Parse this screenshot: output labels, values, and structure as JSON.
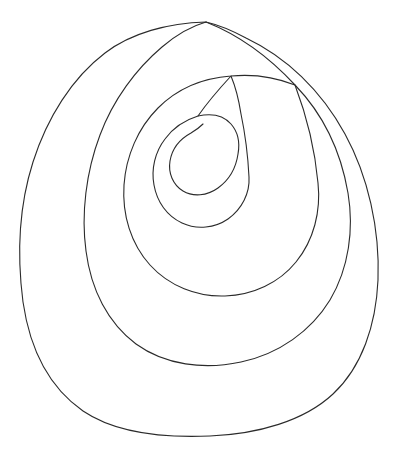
{
  "artwork": {
    "title": "Spiral Outline Drawing",
    "kind": "line-art",
    "subject": "egg-shaped archimedean spiral",
    "description": "A single continuous closed black outline drawn as an egg-shaped spiral with about two and a half turns, ending in a sharp point at the top and a rounded teardrop hook at the center.",
    "background_color": "#ffffff",
    "stroke_color": "#2b2b2b",
    "stroke_width_px": 1.1,
    "fill": "none",
    "canvas": {
      "width_px": 394,
      "height_px": 460
    },
    "geometry": {
      "center_x": 200,
      "center_y": 215,
      "outer_tip_x": 206,
      "outer_tip_y": 22,
      "inner_hook_x": 215,
      "inner_hook_y": 150,
      "bounds": {
        "left_px": 20,
        "right_px": 378,
        "top_px": 21,
        "bottom_px": 436
      },
      "turns": 2.5,
      "path_d": "M 206 22 C 150 24 104 50 74 90 C 42 132 24 186 21 240 C 18 300 33 356 69 396 C 106 437 162 456 219 452 C 283 447 337 414 360 356 C 384 296 382 226 364 162 C 346 100 310 56 258 36 C 238 28 222 24 206 22 Z M 206 22 C 216 22 223 24 230 27 C 278 47 311 90 327 146 C 344 206 345 271 323 325 C 302 376 254 405 199 409 C 148 412 99 395 67 359 C 35 322 22 272 25 219 C 28 170 44 121 73 83 C 101 47 143 24 189 22 C 195 22 201 22 206 22 Z M 189 22 C 185 22 181 22 178 23 L 178 23 C 178 23 178 23 178 23 Z M 178 23 C 178 23 178 23 178 23 Z M 327 146 C 311 90 278 47 230 27 C 230 27 230 27 230 27 Z",
      "segments": [
        {
          "name": "outer-spiral-arm",
          "note": "outermost egg-shaped loop running from the sharp top tip clockwise around the full figure"
        },
        {
          "name": "second-spiral-arm",
          "note": "second concentric loop nested inside the outer arm"
        },
        {
          "name": "third-spiral-arm",
          "note": "third loop surrounding the small central region"
        },
        {
          "name": "inner-hook",
          "note": "innermost curl ending as a rounded teardrop at the spiral core"
        }
      ]
    }
  }
}
